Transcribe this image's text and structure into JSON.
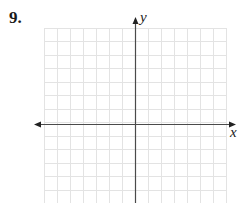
{
  "problem": {
    "number": "9."
  },
  "graph": {
    "x_axis_label": "x",
    "y_axis_label": "y",
    "grid_columns": 14,
    "grid_rows": 13,
    "colors": {
      "grid": "#e3e3e3",
      "axis": "#4a4a4a",
      "text": "#222222"
    }
  }
}
